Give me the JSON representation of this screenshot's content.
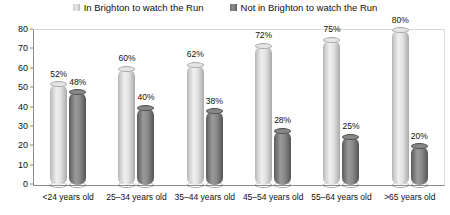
{
  "chart_data": {
    "type": "bar",
    "title": "",
    "xlabel": "",
    "ylabel": "",
    "ylim": [
      0,
      80
    ],
    "yticks": [
      0,
      10,
      20,
      30,
      40,
      50,
      60,
      70,
      80
    ],
    "grid": false,
    "legend_position": "top-center",
    "categories": [
      "<24 years old",
      "25–34 years old",
      "35–44 years old",
      "45–54 years old",
      "55–64 years old",
      ">65 years old"
    ],
    "series": [
      {
        "name": "In Brighton to watch the Run",
        "color": "#e0e0e0",
        "values": [
          52,
          60,
          62,
          72,
          75,
          80
        ],
        "labels": [
          "52%",
          "60%",
          "62%",
          "72%",
          "75%",
          "80%"
        ]
      },
      {
        "name": "Not in Brighton to watch the Run",
        "color": "#808080",
        "values": [
          48,
          40,
          38,
          28,
          25,
          20
        ],
        "labels": [
          "48%",
          "40%",
          "38%",
          "28%",
          "25%",
          "20%"
        ]
      }
    ]
  }
}
